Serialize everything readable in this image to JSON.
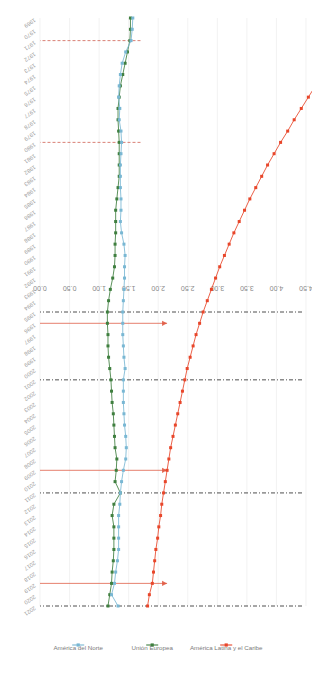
{
  "chart_data": {
    "type": "line",
    "title": "",
    "subtitle": "",
    "xlabel": "",
    "ylabel": "",
    "orientation": "rotated-90",
    "grid": true,
    "legend_position": "right",
    "value_axis": {
      "ticks": [
        "4.50",
        "4.00",
        "3.50",
        "3.00",
        "2.50",
        "2.00",
        "1.50",
        "1.00",
        "0.50",
        "0.00"
      ],
      "min": 0.0,
      "max": 4.5,
      "direction": "descending"
    },
    "categories": [
      "1969",
      "1970",
      "1971",
      "1972",
      "1973",
      "1974",
      "1975",
      "1976",
      "1977",
      "1978",
      "1979",
      "1980",
      "1981",
      "1982",
      "1983",
      "1984",
      "1985",
      "1986",
      "1987",
      "1988",
      "1989",
      "1990",
      "1991",
      "1992",
      "1993",
      "1994",
      "1995",
      "1996",
      "1997",
      "1998",
      "1999",
      "2000",
      "2001",
      "2002",
      "2003",
      "2004",
      "2005",
      "2006",
      "2007",
      "2008",
      "2009",
      "2010",
      "2011",
      "2012",
      "2013",
      "2014",
      "2015",
      "2016",
      "2017",
      "2018",
      "2019",
      "2020",
      "2021"
    ],
    "series": [
      {
        "name": "América Latina y el Caribe",
        "color": "#e8462a",
        "values": [
          5.35,
          5.24,
          5.13,
          5.01,
          4.9,
          4.78,
          4.66,
          4.54,
          4.42,
          4.3,
          4.19,
          4.07,
          3.96,
          3.85,
          3.75,
          3.65,
          3.55,
          3.46,
          3.37,
          3.28,
          3.2,
          3.12,
          3.04,
          2.97,
          2.9,
          2.83,
          2.76,
          2.7,
          2.64,
          2.59,
          2.54,
          2.49,
          2.45,
          2.41,
          2.37,
          2.33,
          2.29,
          2.25,
          2.21,
          2.18,
          2.15,
          2.12,
          2.09,
          2.06,
          2.04,
          2.01,
          1.99,
          1.96,
          1.94,
          1.92,
          1.9,
          1.85,
          1.82
        ]
      },
      {
        "name": "Unión Europea",
        "color": "#3f7f3f",
        "values": [
          1.53,
          1.53,
          1.52,
          1.48,
          1.44,
          1.4,
          1.36,
          1.34,
          1.32,
          1.32,
          1.33,
          1.34,
          1.34,
          1.34,
          1.34,
          1.32,
          1.3,
          1.28,
          1.28,
          1.28,
          1.27,
          1.27,
          1.26,
          1.23,
          1.19,
          1.16,
          1.14,
          1.14,
          1.15,
          1.15,
          1.16,
          1.18,
          1.2,
          1.21,
          1.22,
          1.24,
          1.25,
          1.26,
          1.27,
          1.3,
          1.29,
          1.27,
          1.36,
          1.25,
          1.22,
          1.25,
          1.25,
          1.25,
          1.24,
          1.22,
          1.21,
          1.18,
          1.15
        ]
      },
      {
        "name": "América del Norte",
        "color": "#79b7d3",
        "values": [
          1.57,
          1.56,
          1.54,
          1.45,
          1.39,
          1.36,
          1.34,
          1.33,
          1.35,
          1.34,
          1.37,
          1.38,
          1.37,
          1.36,
          1.36,
          1.36,
          1.37,
          1.37,
          1.36,
          1.38,
          1.42,
          1.44,
          1.43,
          1.43,
          1.42,
          1.41,
          1.4,
          1.4,
          1.4,
          1.41,
          1.42,
          1.44,
          1.41,
          1.41,
          1.41,
          1.42,
          1.43,
          1.45,
          1.46,
          1.45,
          1.41,
          1.38,
          1.36,
          1.35,
          1.33,
          1.33,
          1.33,
          1.33,
          1.31,
          1.28,
          1.26,
          1.21,
          1.32
        ]
      }
    ],
    "reference_lines": [
      {
        "at": "2021",
        "style": "dash-dot",
        "color": "#222222"
      },
      {
        "at": "2011",
        "style": "dash-dot",
        "color": "#222222"
      },
      {
        "at": "2001",
        "style": "dash-dot",
        "color": "#222222"
      },
      {
        "at": "1995",
        "style": "dash-dot",
        "color": "#222222"
      },
      {
        "at": "1980",
        "style": "dash-dot",
        "color": "#c94b3b"
      },
      {
        "at": "1971",
        "style": "dash-dot",
        "color": "#c94b3b"
      }
    ],
    "arrows": [
      {
        "at": "2019",
        "color": "#e05a42"
      },
      {
        "at": "2009",
        "color": "#e05a42"
      },
      {
        "at": "1996",
        "color": "#e05a42"
      }
    ]
  },
  "legend": {
    "items": [
      {
        "label": "América Latina y el Caribe",
        "color": "#e8462a"
      },
      {
        "label": "Unión Europea",
        "color": "#3f7f3f"
      },
      {
        "label": "América del Norte",
        "color": "#79b7d3"
      }
    ]
  }
}
